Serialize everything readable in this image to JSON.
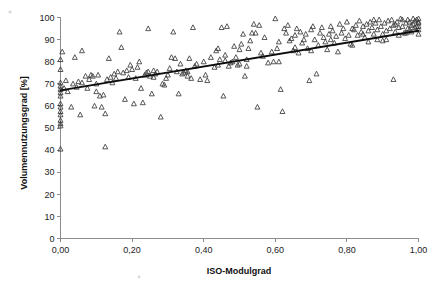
{
  "chart_data": {
    "type": "scatter",
    "title": "",
    "xlabel": "ISO-Modulgrad",
    "ylabel": "Volumennutzungsgrad [%]",
    "xlim": [
      0,
      1
    ],
    "ylim": [
      0,
      100
    ],
    "grid": false,
    "legend": "none",
    "marker": "open-triangle",
    "x_tick_labels": [
      "0,00",
      "0,20",
      "0,40",
      "0,60",
      "0,80",
      "1,00"
    ],
    "x_tick_values": [
      0,
      0.2,
      0.4,
      0.6,
      0.8,
      1
    ],
    "y_tick_labels": [
      "0",
      "10",
      "20",
      "30",
      "40",
      "50",
      "60",
      "70",
      "80",
      "90",
      "100"
    ],
    "y_tick_values": [
      0,
      10,
      20,
      30,
      40,
      50,
      60,
      70,
      80,
      90,
      100
    ],
    "trendline": {
      "type": "linear",
      "x": [
        0,
        1
      ],
      "y": [
        67.0,
        94.0
      ],
      "color": "#0d0d0d"
    },
    "series": [
      {
        "name": "Messpunkte",
        "color": "#3a3a3a",
        "points": [
          [
            0.0,
            81.0
          ],
          [
            0.0,
            76.5
          ],
          [
            0.0,
            70.5
          ],
          [
            0.0,
            69.0
          ],
          [
            0.0,
            67.5
          ],
          [
            0.0,
            66.0
          ],
          [
            0.0,
            64.5
          ],
          [
            0.0,
            61.0
          ],
          [
            0.0,
            59.5
          ],
          [
            0.0,
            57.5
          ],
          [
            0.0,
            56.0
          ],
          [
            0.0,
            53.5
          ],
          [
            0.0,
            52.0
          ],
          [
            0.0,
            51.0
          ],
          [
            0.0,
            40.5
          ],
          [
            0.005,
            84.5
          ],
          [
            0.01,
            68.0
          ],
          [
            0.015,
            71.5
          ],
          [
            0.02,
            66.5
          ],
          [
            0.03,
            59.5
          ],
          [
            0.035,
            70.0
          ],
          [
            0.04,
            82.0
          ],
          [
            0.045,
            68.5
          ],
          [
            0.05,
            71.0
          ],
          [
            0.055,
            56.0
          ],
          [
            0.06,
            85.0
          ],
          [
            0.06,
            70.5
          ],
          [
            0.07,
            73.5
          ],
          [
            0.075,
            68.0
          ],
          [
            0.08,
            72.0
          ],
          [
            0.085,
            74.0
          ],
          [
            0.09,
            73.5
          ],
          [
            0.095,
            60.0
          ],
          [
            0.1,
            70.0
          ],
          [
            0.1,
            66.5
          ],
          [
            0.105,
            74.0
          ],
          [
            0.11,
            64.5
          ],
          [
            0.115,
            59.5
          ],
          [
            0.12,
            65.0
          ],
          [
            0.125,
            41.5
          ],
          [
            0.125,
            56.5
          ],
          [
            0.13,
            72.0
          ],
          [
            0.135,
            81.5
          ],
          [
            0.14,
            73.0
          ],
          [
            0.145,
            70.5
          ],
          [
            0.15,
            74.5
          ],
          [
            0.155,
            72.5
          ],
          [
            0.16,
            75.5
          ],
          [
            0.165,
            93.5
          ],
          [
            0.17,
            86.5
          ],
          [
            0.175,
            75.0
          ],
          [
            0.18,
            63.0
          ],
          [
            0.185,
            76.0
          ],
          [
            0.19,
            73.0
          ],
          [
            0.195,
            78.5
          ],
          [
            0.2,
            76.5
          ],
          [
            0.205,
            61.0
          ],
          [
            0.21,
            72.5
          ],
          [
            0.215,
            77.5
          ],
          [
            0.22,
            80.0
          ],
          [
            0.225,
            68.0
          ],
          [
            0.23,
            61.5
          ],
          [
            0.235,
            74.0
          ],
          [
            0.24,
            75.0
          ],
          [
            0.245,
            95.0
          ],
          [
            0.25,
            73.5
          ],
          [
            0.255,
            65.5
          ],
          [
            0.26,
            76.0
          ],
          [
            0.265,
            74.5
          ],
          [
            0.27,
            75.5
          ],
          [
            0.28,
            55.0
          ],
          [
            0.285,
            70.0
          ],
          [
            0.29,
            69.5
          ],
          [
            0.3,
            74.0
          ],
          [
            0.305,
            77.0
          ],
          [
            0.31,
            82.0
          ],
          [
            0.315,
            93.5
          ],
          [
            0.32,
            81.5
          ],
          [
            0.325,
            75.5
          ],
          [
            0.33,
            65.5
          ],
          [
            0.335,
            79.0
          ],
          [
            0.34,
            74.5
          ],
          [
            0.345,
            75.0
          ],
          [
            0.35,
            76.0
          ],
          [
            0.355,
            75.5
          ],
          [
            0.36,
            81.5
          ],
          [
            0.365,
            72.5
          ],
          [
            0.37,
            95.5
          ],
          [
            0.375,
            78.0
          ],
          [
            0.38,
            79.0
          ],
          [
            0.39,
            72.0
          ],
          [
            0.4,
            80.0
          ],
          [
            0.405,
            74.0
          ],
          [
            0.41,
            71.5
          ],
          [
            0.42,
            82.0
          ],
          [
            0.43,
            77.5
          ],
          [
            0.435,
            85.0
          ],
          [
            0.44,
            86.0
          ],
          [
            0.445,
            81.0
          ],
          [
            0.45,
            95.5
          ],
          [
            0.455,
            64.5
          ],
          [
            0.46,
            83.0
          ],
          [
            0.465,
            96.0
          ],
          [
            0.47,
            78.0
          ],
          [
            0.475,
            79.5
          ],
          [
            0.48,
            80.0
          ],
          [
            0.485,
            87.0
          ],
          [
            0.49,
            82.0
          ],
          [
            0.495,
            78.5
          ],
          [
            0.5,
            85.5
          ],
          [
            0.505,
            88.0
          ],
          [
            0.51,
            92.5
          ],
          [
            0.515,
            73.5
          ],
          [
            0.52,
            81.0
          ],
          [
            0.525,
            86.0
          ],
          [
            0.53,
            89.5
          ],
          [
            0.535,
            93.0
          ],
          [
            0.54,
            97.0
          ],
          [
            0.545,
            93.0
          ],
          [
            0.55,
            59.5
          ],
          [
            0.555,
            96.5
          ],
          [
            0.56,
            84.0
          ],
          [
            0.565,
            82.5
          ],
          [
            0.57,
            91.0
          ],
          [
            0.58,
            79.5
          ],
          [
            0.59,
            84.5
          ],
          [
            0.595,
            80.0
          ],
          [
            0.6,
            99.5
          ],
          [
            0.605,
            86.0
          ],
          [
            0.61,
            89.0
          ],
          [
            0.615,
            67.5
          ],
          [
            0.62,
            57.5
          ],
          [
            0.625,
            95.0
          ],
          [
            0.63,
            93.0
          ],
          [
            0.635,
            96.5
          ],
          [
            0.64,
            89.5
          ],
          [
            0.645,
            90.5
          ],
          [
            0.65,
            85.0
          ],
          [
            0.655,
            92.0
          ],
          [
            0.66,
            95.0
          ],
          [
            0.665,
            84.0
          ],
          [
            0.67,
            93.5
          ],
          [
            0.675,
            88.5
          ],
          [
            0.68,
            90.0
          ],
          [
            0.685,
            92.5
          ],
          [
            0.69,
            86.0
          ],
          [
            0.695,
            71.5
          ],
          [
            0.7,
            94.5
          ],
          [
            0.705,
            96.0
          ],
          [
            0.71,
            90.0
          ],
          [
            0.715,
            74.5
          ],
          [
            0.72,
            87.5
          ],
          [
            0.725,
            93.0
          ],
          [
            0.73,
            95.5
          ],
          [
            0.735,
            91.0
          ],
          [
            0.74,
            89.0
          ],
          [
            0.745,
            85.5
          ],
          [
            0.75,
            92.5
          ],
          [
            0.755,
            96.0
          ],
          [
            0.76,
            94.0
          ],
          [
            0.765,
            88.5
          ],
          [
            0.77,
            91.5
          ],
          [
            0.775,
            84.5
          ],
          [
            0.78,
            97.0
          ],
          [
            0.785,
            93.0
          ],
          [
            0.79,
            95.0
          ],
          [
            0.795,
            90.5
          ],
          [
            0.8,
            98.0
          ],
          [
            0.805,
            92.0
          ],
          [
            0.81,
            88.0
          ],
          [
            0.815,
            87.5
          ],
          [
            0.82,
            94.5
          ],
          [
            0.825,
            96.5
          ],
          [
            0.83,
            92.0
          ],
          [
            0.835,
            98.5
          ],
          [
            0.84,
            93.5
          ],
          [
            0.845,
            96.0
          ],
          [
            0.85,
            91.0
          ],
          [
            0.855,
            97.0
          ],
          [
            0.86,
            94.0
          ],
          [
            0.865,
            98.0
          ],
          [
            0.87,
            95.5
          ],
          [
            0.875,
            92.5
          ],
          [
            0.88,
            97.5
          ],
          [
            0.885,
            94.5
          ],
          [
            0.89,
            99.0
          ],
          [
            0.895,
            96.0
          ],
          [
            0.9,
            89.5
          ],
          [
            0.905,
            97.5
          ],
          [
            0.91,
            94.0
          ],
          [
            0.915,
            98.5
          ],
          [
            0.92,
            95.0
          ],
          [
            0.925,
            99.0
          ],
          [
            0.93,
            72.0
          ],
          [
            0.93,
            96.5
          ],
          [
            0.935,
            93.5
          ],
          [
            0.94,
            98.0
          ],
          [
            0.945,
            95.5
          ],
          [
            0.95,
            99.5
          ],
          [
            0.955,
            96.0
          ],
          [
            0.96,
            93.0
          ],
          [
            0.965,
            97.5
          ],
          [
            0.97,
            99.0
          ],
          [
            0.97,
            95.0
          ],
          [
            0.975,
            98.0
          ],
          [
            0.98,
            96.5
          ],
          [
            0.98,
            93.5
          ],
          [
            0.985,
            99.5
          ],
          [
            0.985,
            97.0
          ],
          [
            0.99,
            95.5
          ],
          [
            0.99,
            98.5
          ],
          [
            0.995,
            96.0
          ],
          [
            0.995,
            99.0
          ],
          [
            1.0,
            97.5
          ],
          [
            1.0,
            94.5
          ],
          [
            1.0,
            99.5
          ],
          [
            1.0,
            96.0
          ],
          [
            1.0,
            92.5
          ],
          [
            1.0,
            98.0
          ],
          [
            0.885,
            90.0
          ],
          [
            0.86,
            89.0
          ],
          [
            0.9,
            92.5
          ],
          [
            0.945,
            92.0
          ],
          [
            0.955,
            99.0
          ],
          [
            0.965,
            93.0
          ],
          [
            0.975,
            94.5
          ],
          [
            0.935,
            97.0
          ],
          [
            0.52,
            78.0
          ],
          [
            0.46,
            80.5
          ],
          [
            0.5,
            79.0
          ],
          [
            0.44,
            78.5
          ],
          [
            0.245,
            75.5
          ],
          [
            0.26,
            73.0
          ],
          [
            0.295,
            72.5
          ],
          [
            0.355,
            73.5
          ],
          [
            0.61,
            80.0
          ],
          [
            0.655,
            86.5
          ],
          [
            0.7,
            85.0
          ],
          [
            0.755,
            90.0
          ],
          [
            0.815,
            95.0
          ],
          [
            0.845,
            92.5
          ],
          [
            0.875,
            99.0
          ],
          [
            0.91,
            90.0
          ]
        ]
      }
    ]
  },
  "axes": {
    "x_title": "ISO-Modulgrad",
    "y_title": "Volumennutzungsgrad [%]"
  }
}
